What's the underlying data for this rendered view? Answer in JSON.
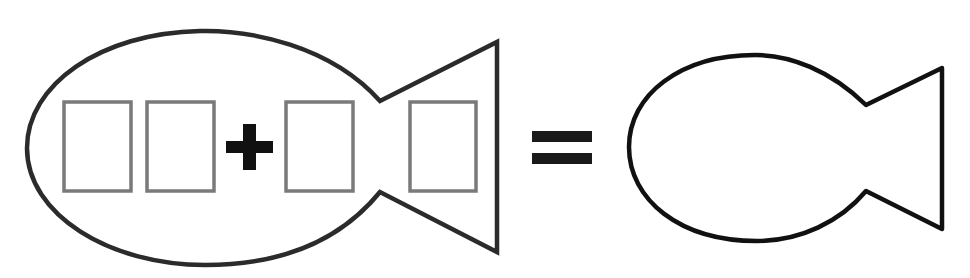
{
  "title": "Fish addition puzzle: two-digit number plus one-digit number equals a fish",
  "colors": {
    "background": "#ffffff",
    "fish_outline": "#2b2b2b",
    "box_outline": "#7a7a7a",
    "operator": "#111111"
  },
  "left_fish": {
    "description": "Fish containing the expression",
    "boxes": [
      {
        "label": "tens digit box",
        "value": ""
      },
      {
        "label": "ones digit box",
        "value": ""
      },
      {
        "label": "addend digit box",
        "value": ""
      },
      {
        "label": "tail digit box",
        "value": ""
      }
    ],
    "operator": "+"
  },
  "equals": "=",
  "right_fish": {
    "description": "Empty answer fish",
    "value": ""
  }
}
